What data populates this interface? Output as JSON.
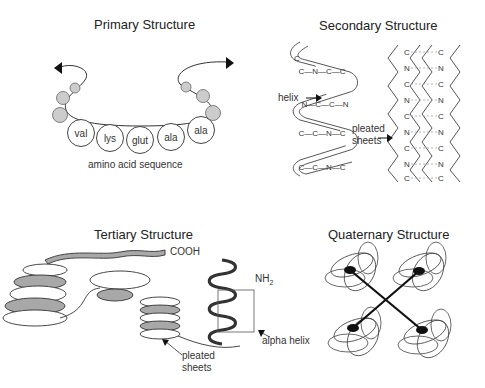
{
  "panels": {
    "primary": {
      "title": "Primary Structure",
      "amino_acids": [
        "val",
        "lys",
        "glut",
        "ala",
        "ala"
      ],
      "caption": "amino acid sequence"
    },
    "secondary": {
      "title": "Secondary Structure",
      "helix_label": "helix",
      "sheets_label_line1": "pleated",
      "sheets_label_line2": "sheets",
      "helix_atoms": [
        "C",
        "C—N—C—C",
        "N—C—C—N",
        "C—C—N—C",
        "C—C—N—C"
      ],
      "sheet_atoms": [
        "C",
        "N",
        "C",
        "N",
        "C",
        "N",
        "C",
        "N",
        "C"
      ]
    },
    "tertiary": {
      "title": "Tertiary Structure",
      "cooh_label": "COOH",
      "nh2_label": "NH",
      "nh2_sub": "2",
      "sheets_label_line1": "pleated",
      "sheets_label_line2": "sheets",
      "alpha_helix_label": "alpha helix"
    },
    "quaternary": {
      "title": "Quaternary Structure"
    }
  },
  "colors": {
    "ribbon_shade": "#a8a8a8",
    "line": "#333333",
    "sphere": "#cccccc"
  }
}
